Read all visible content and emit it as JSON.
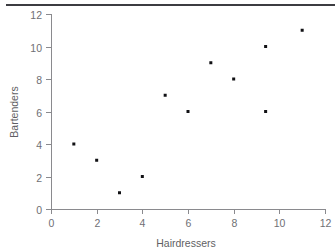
{
  "chart_data": {
    "type": "scatter",
    "title": "",
    "xlabel": "Hairdressers",
    "ylabel": "Bartenders",
    "xlim": [
      0,
      12
    ],
    "ylim": [
      0,
      12
    ],
    "xticks": [
      0,
      2,
      4,
      6,
      8,
      10,
      12
    ],
    "yticks": [
      0,
      2,
      4,
      6,
      8,
      10,
      12
    ],
    "xtick_labels": [
      "0",
      "2",
      "4",
      "6",
      "8",
      "10",
      "12"
    ],
    "ytick_labels": [
      "0",
      "2",
      "4",
      "6",
      "8",
      "10",
      "12"
    ],
    "grid": false,
    "legend": null,
    "marker": "square",
    "marker_color": "#111114",
    "marker_size": 3,
    "points": [
      {
        "x": 1,
        "y": 4
      },
      {
        "x": 2,
        "y": 3
      },
      {
        "x": 3,
        "y": 1
      },
      {
        "x": 4,
        "y": 2
      },
      {
        "x": 5,
        "y": 7
      },
      {
        "x": 6,
        "y": 6
      },
      {
        "x": 7,
        "y": 9
      },
      {
        "x": 8,
        "y": 8
      },
      {
        "x": 9.4,
        "y": 6
      },
      {
        "x": 9.4,
        "y": 10
      },
      {
        "x": 11,
        "y": 11
      }
    ]
  },
  "figure": {
    "axis_color": "#8a8a8e",
    "tick_label_color": "#6f6f74",
    "axis_title_color": "#5f5f64",
    "background": "#ffffff",
    "top_rule_color": "#3c3c41"
  }
}
